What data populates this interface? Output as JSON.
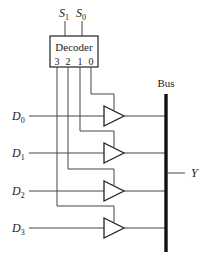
{
  "diagram": {
    "type": "bus-multiplexer-with-tristate-buffers",
    "decoder": {
      "label": "Decoder",
      "select_inputs": [
        {
          "name": "S",
          "sub": "1"
        },
        {
          "name": "S",
          "sub": "0"
        }
      ],
      "outputs": [
        "3",
        "2",
        "1",
        "0"
      ]
    },
    "data_inputs": [
      {
        "name": "D",
        "sub": "0"
      },
      {
        "name": "D",
        "sub": "1"
      },
      {
        "name": "D",
        "sub": "2"
      },
      {
        "name": "D",
        "sub": "3"
      }
    ],
    "bus_label": "Bus",
    "output_label": "Y",
    "colors": {
      "line": "#444444",
      "bus": "#111111",
      "background": "#ffffff"
    }
  }
}
